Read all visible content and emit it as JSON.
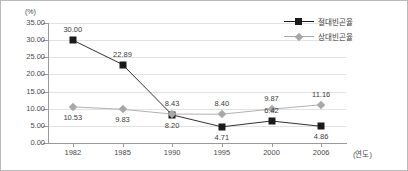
{
  "chart_data": {
    "type": "line",
    "title": "",
    "xlabel": "(연도)",
    "ylabel": "(%)",
    "categories": [
      "1982",
      "1985",
      "1990",
      "1995",
      "2000",
      "2006"
    ],
    "ylim": [
      0,
      35
    ],
    "ytick_step": 5,
    "ytick_labels": [
      "0.00",
      "5.00",
      "10.00",
      "15.00",
      "20.00",
      "25.00",
      "30.00",
      "35.00"
    ],
    "grid": true,
    "legend_position": "top-right",
    "series": [
      {
        "name": "절대빈곤율",
        "marker": "square",
        "color": "#1a1a1a",
        "values": [
          30.0,
          22.89,
          8.2,
          4.71,
          6.42,
          4.86
        ],
        "labels": [
          "30.00",
          "22.89",
          "8.20",
          "4.71",
          "6.42",
          "4.86"
        ]
      },
      {
        "name": "상대빈곤율",
        "marker": "diamond",
        "color": "#a8a8a8",
        "values": [
          10.53,
          9.83,
          8.43,
          8.4,
          9.87,
          11.16
        ],
        "labels": [
          "10.53",
          "9.83",
          "8.43",
          "8.40",
          "9.87",
          "11.16"
        ]
      }
    ]
  },
  "colors": {
    "absolute": "#1a1a1a",
    "relative": "#a8a8a8",
    "grid": "#e2e2e2",
    "axis": "#9a9a9a",
    "border": "#b9b9b9",
    "text": "#3b3b3b"
  }
}
